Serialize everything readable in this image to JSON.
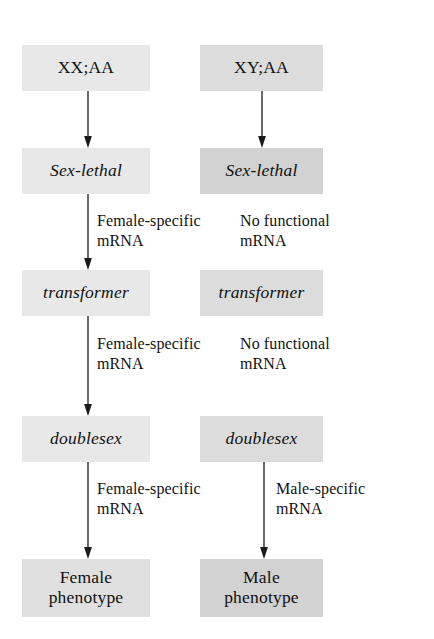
{
  "figure": {
    "background_color": "#ffffff",
    "text_color": "#111111"
  },
  "columns": [
    {
      "id": "female",
      "name": "female-pathway"
    },
    {
      "id": "male",
      "name": "male-pathway"
    }
  ],
  "nodes": [
    {
      "id": "karyotype_female",
      "label": "XX;AA",
      "style": "plain",
      "shade": "#e8e8e8",
      "column": "female",
      "row": 0
    },
    {
      "id": "karyotype_male",
      "label": "XY;AA",
      "style": "plain",
      "shade": "#dcdcdc",
      "column": "male",
      "row": 0
    },
    {
      "id": "sxl_female",
      "label": "Sex-lethal",
      "style": "gene",
      "shade": "#e8e8e8",
      "column": "female",
      "row": 1
    },
    {
      "id": "sxl_male",
      "label": "Sex-lethal",
      "style": "gene",
      "shade": "#d2d2d2",
      "column": "male",
      "row": 1
    },
    {
      "id": "tra_female",
      "label": "transformer",
      "style": "gene",
      "shade": "#e8e8e8",
      "column": "female",
      "row": 2
    },
    {
      "id": "tra_male",
      "label": "transformer",
      "style": "gene",
      "shade": "#dcdcdc",
      "column": "male",
      "row": 2
    },
    {
      "id": "dsx_female",
      "label": "doublesex",
      "style": "gene",
      "shade": "#e8e8e8",
      "column": "female",
      "row": 3
    },
    {
      "id": "dsx_male",
      "label": "doublesex",
      "style": "gene",
      "shade": "#dcdcdc",
      "column": "male",
      "row": 3
    },
    {
      "id": "pheno_female",
      "label_line1": "Female",
      "label_line2": "phenotype",
      "style": "plain",
      "shade": "#e0e0e0",
      "column": "female",
      "row": 4
    },
    {
      "id": "pheno_male",
      "label_line1": "Male",
      "label_line2": "phenotype",
      "style": "plain",
      "shade": "#d2d2d2",
      "column": "male",
      "row": 4
    }
  ],
  "edges": [
    {
      "id": "e_f_karyo_sxl",
      "from": "karyotype_female",
      "to": "sxl_female",
      "arrow": true,
      "label_line1": "",
      "label_line2": ""
    },
    {
      "id": "e_m_karyo_sxl",
      "from": "karyotype_male",
      "to": "sxl_male",
      "arrow": true,
      "label_line1": "",
      "label_line2": ""
    },
    {
      "id": "e_f_sxl_tra",
      "from": "sxl_female",
      "to": "tra_female",
      "arrow": true,
      "label_line1": "Female-specific",
      "label_line2": "mRNA"
    },
    {
      "id": "e_m_sxl_tra",
      "from": "sxl_male",
      "to": "tra_male",
      "arrow": false,
      "label_line1": "No functional",
      "label_line2": "mRNA"
    },
    {
      "id": "e_f_tra_dsx",
      "from": "tra_female",
      "to": "dsx_female",
      "arrow": true,
      "label_line1": "Female-specific",
      "label_line2": "mRNA"
    },
    {
      "id": "e_m_tra_dsx",
      "from": "tra_male",
      "to": "dsx_male",
      "arrow": false,
      "label_line1": "No functional",
      "label_line2": "mRNA"
    },
    {
      "id": "e_f_dsx_pheno",
      "from": "dsx_female",
      "to": "pheno_female",
      "arrow": true,
      "label_line1": "Female-specific",
      "label_line2": "mRNA"
    },
    {
      "id": "e_m_dsx_pheno",
      "from": "dsx_male",
      "to": "pheno_male",
      "arrow": true,
      "label_line1": "Male-specific",
      "label_line2": "mRNA"
    }
  ]
}
